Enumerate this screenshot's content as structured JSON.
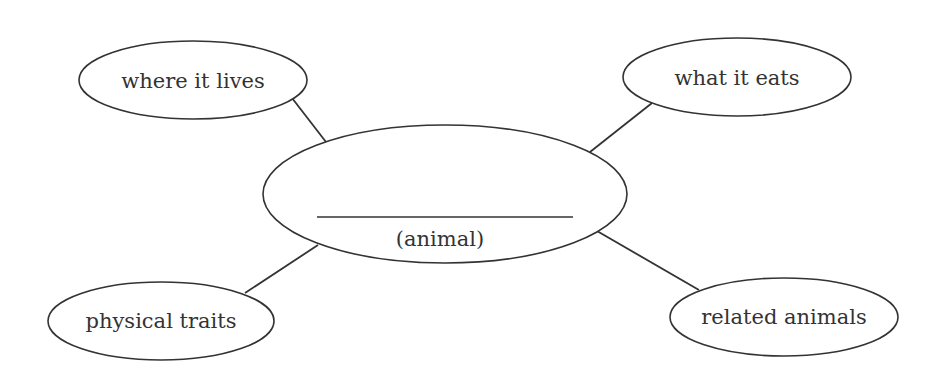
{
  "diagram": {
    "type": "concept-web",
    "colors": {
      "stroke": "#333333",
      "text": "#333333",
      "background": "#ffffff"
    },
    "center": {
      "blank_line": true,
      "label": "(animal)"
    },
    "nodes": [
      {
        "id": "where-it-lives",
        "label": "where it lives",
        "position": "top-left"
      },
      {
        "id": "what-it-eats",
        "label": "what it eats",
        "position": "top-right"
      },
      {
        "id": "physical-traits",
        "label": "physical traits",
        "position": "bottom-left"
      },
      {
        "id": "related-animals",
        "label": "related animals",
        "position": "bottom-right"
      }
    ]
  }
}
